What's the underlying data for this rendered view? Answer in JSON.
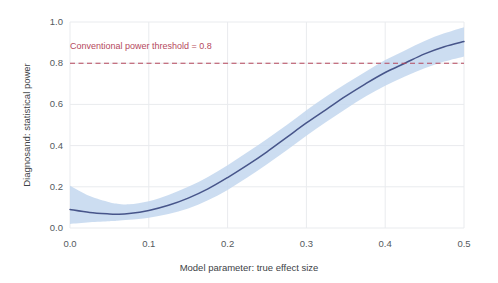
{
  "chart_data": {
    "type": "line",
    "title": "",
    "subtitle": "",
    "xlabel": "Model parameter: true effect size",
    "ylabel": "Diagnosand: statistical power",
    "xlim": [
      0.0,
      0.5
    ],
    "ylim": [
      0.0,
      1.0
    ],
    "xticks": [
      "0.0",
      "0.1",
      "0.2",
      "0.3",
      "0.4",
      "0.5"
    ],
    "xtick_values": [
      0.0,
      0.1,
      0.2,
      0.3,
      0.4,
      0.5
    ],
    "yticks": [
      "0.0",
      "0.2",
      "0.4",
      "0.6",
      "0.8",
      "1.0"
    ],
    "ytick_values": [
      0.0,
      0.2,
      0.4,
      0.6,
      0.8,
      1.0
    ],
    "grid": true,
    "legend": "none",
    "series": [
      {
        "name": "statistical power",
        "kind": "smooth-line-with-ribbon",
        "line_color": "#47558a",
        "ribbon_color": "#c3d7ee",
        "x": [
          0.0,
          0.025,
          0.05,
          0.06,
          0.075,
          0.1,
          0.125,
          0.15,
          0.175,
          0.2,
          0.225,
          0.25,
          0.275,
          0.3,
          0.325,
          0.35,
          0.375,
          0.4,
          0.425,
          0.45,
          0.475,
          0.5
        ],
        "values": [
          0.09,
          0.075,
          0.068,
          0.067,
          0.07,
          0.085,
          0.11,
          0.145,
          0.19,
          0.245,
          0.305,
          0.37,
          0.44,
          0.51,
          0.575,
          0.64,
          0.7,
          0.755,
          0.8,
          0.845,
          0.88,
          0.905
        ],
        "ribbon_low": [
          0.02,
          0.028,
          0.033,
          0.035,
          0.04,
          0.05,
          0.068,
          0.095,
          0.135,
          0.185,
          0.245,
          0.31,
          0.378,
          0.448,
          0.515,
          0.578,
          0.638,
          0.69,
          0.735,
          0.775,
          0.808,
          0.833
        ],
        "ribbon_high": [
          0.205,
          0.155,
          0.125,
          0.118,
          0.115,
          0.13,
          0.16,
          0.2,
          0.248,
          0.305,
          0.368,
          0.432,
          0.5,
          0.572,
          0.638,
          0.7,
          0.758,
          0.815,
          0.862,
          0.908,
          0.945,
          0.975
        ]
      }
    ],
    "annotations": [
      {
        "name": "power-threshold",
        "text": "Conventional power threshold = 0.8",
        "y_value": 0.8,
        "color": "#b5485d",
        "linestyle": "dashed"
      }
    ]
  }
}
